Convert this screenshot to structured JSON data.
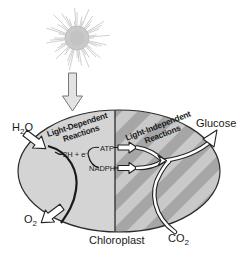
{
  "figure": {
    "caption_label": "Chloroplast"
  },
  "regions": {
    "light_dependent": {
      "line1": "Light-Dependent",
      "line2": "Reactions"
    },
    "light_independent": {
      "line1": "Light-Independent",
      "line2": "Reactions"
    }
  },
  "labels": {
    "water": {
      "pre": "H",
      "sub": "2",
      "post": "O"
    },
    "oxygen": {
      "pre": "O",
      "sub": "2",
      "post": ""
    },
    "carbon_dioxide": {
      "pre": "CO",
      "sub": "2",
      "post": ""
    },
    "glucose": "Glucose",
    "atp": "ATP",
    "nadph": "NADPH",
    "electrons": {
      "pre": "2H + e",
      "sup": "-"
    }
  },
  "icons": {
    "sun": "sun-burst-icon",
    "light_arrow": "down-block-arrow",
    "water_in_arrow": "block-arrow",
    "oxygen_out_arrow": "block-arrow",
    "glucose_out_arrow": "open-arrowhead"
  },
  "colors": {
    "background": "#ffffff",
    "chloroplast_left": "#d4d4d4",
    "stripe_dark": "#a6a6a6",
    "stripe_light": "#c9c9c9",
    "outline": "#2b2b2b",
    "sun_core": "#c9c9c9",
    "sun_ray": "#c3c3c3",
    "light_arrow_fill": "#e3e3e3",
    "text": "#1a1a1a"
  }
}
